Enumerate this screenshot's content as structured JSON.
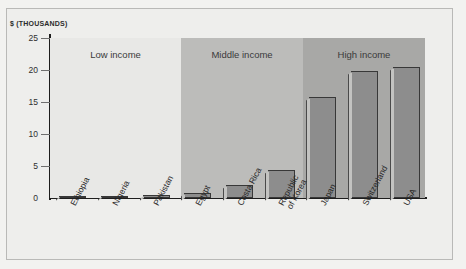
{
  "axis": {
    "y_title": "$ (THOUSANDS)",
    "y_ticks": [
      "0",
      "5",
      "10",
      "15",
      "20",
      "25"
    ],
    "y_min": 0,
    "y_max": 25
  },
  "bands": [
    {
      "key": "low",
      "label": "Low income"
    },
    {
      "key": "middle",
      "label": "Middle income"
    },
    {
      "key": "high",
      "label": "High income"
    }
  ],
  "categories": [
    "Ethiopia",
    "Nigeria",
    "Pakistan",
    "Egypt",
    "Costa Rica",
    "Republic\nof Korea",
    "Japan",
    "Switzerland",
    "USA"
  ],
  "colors": {
    "band_low": "#e8e8e6",
    "band_middle": "#bcbcba",
    "band_high": "#a8a8a6",
    "bar_face": "#8d8d8d",
    "bar_side": "#c3c3c1",
    "bar_outline": "#383838",
    "page_background": "#eeeeec",
    "axis": "#1d1d1d"
  },
  "chart_data": {
    "type": "bar",
    "title": "",
    "xlabel": "",
    "ylabel": "$ (THOUSANDS)",
    "ylim": [
      0,
      25
    ],
    "grid": false,
    "legend": "none",
    "categories": [
      "Ethiopia",
      "Nigeria",
      "Pakistan",
      "Egypt",
      "Costa Rica",
      "Republic of Korea",
      "Japan",
      "Switzerland",
      "USA"
    ],
    "values": [
      0.2,
      0.3,
      0.4,
      0.8,
      2.0,
      4.3,
      15.8,
      19.8,
      20.4
    ],
    "groups": [
      {
        "label": "Low income",
        "categories": [
          "Ethiopia",
          "Nigeria",
          "Pakistan"
        ]
      },
      {
        "label": "Middle income",
        "categories": [
          "Egypt",
          "Costa Rica",
          "Republic of Korea"
        ]
      },
      {
        "label": "High income",
        "categories": [
          "Japan",
          "Switzerland",
          "USA"
        ]
      }
    ]
  }
}
